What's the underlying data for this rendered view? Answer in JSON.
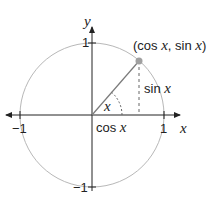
{
  "diagram": {
    "type": "unit-circle",
    "axes": {
      "x_label": "x",
      "y_label": "y",
      "ticks": {
        "x_neg": "−1",
        "x_pos": "1",
        "y_pos": "1",
        "y_neg": "−1"
      }
    },
    "point_label": {
      "open": "(cos ",
      "x1": "x",
      "mid": ", sin ",
      "x2": "x",
      "close": ")"
    },
    "sin_label": {
      "text": "sin ",
      "var": "x"
    },
    "cos_label": {
      "text": "cos ",
      "var": "x"
    },
    "angle_label": "x",
    "colors": {
      "axis": "#222222",
      "circle": "#b8b8b8",
      "radius": "#7a7a7a",
      "point": "#a0a0a0",
      "dashed": "#666666"
    }
  }
}
